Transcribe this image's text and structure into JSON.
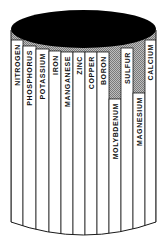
{
  "diagram": {
    "type": "barrel",
    "concept": "law of the minimum",
    "colors": {
      "outline": "#1a1a1a",
      "top_fill": "#000000",
      "stave_fill": "#ffffff",
      "gap_fill": "#9a9a9a"
    },
    "staves": [
      {
        "label": "NITROGEN",
        "x0": 11,
        "x1": 23,
        "top": 40
      },
      {
        "label": "PHOSPHORUS",
        "x0": 23,
        "x1": 36,
        "top": 46
      },
      {
        "label": "POTASSIUM",
        "x0": 36,
        "x1": 49,
        "top": 49
      },
      {
        "label": "IRON",
        "x0": 49,
        "x1": 61,
        "top": 51
      },
      {
        "label": "MANGANESE",
        "x0": 61,
        "x1": 73,
        "top": 52
      },
      {
        "label": "ZINC",
        "x0": 73,
        "x1": 85,
        "top": 52
      },
      {
        "label": "COPPER",
        "x0": 85,
        "x1": 97,
        "top": 52
      },
      {
        "label": "BORON",
        "x0": 97,
        "x1": 109,
        "top": 52
      },
      {
        "label": "MOLYBDENUM",
        "x0": 109,
        "x1": 121,
        "top": 99
      },
      {
        "label": "SULFUR",
        "x0": 121,
        "x1": 133,
        "top": 48
      },
      {
        "label": "MAGNESIUM",
        "x0": 133,
        "x1": 145,
        "top": 93
      },
      {
        "label": "CALCIUM",
        "x0": 145,
        "x1": 156,
        "top": 40
      }
    ]
  }
}
